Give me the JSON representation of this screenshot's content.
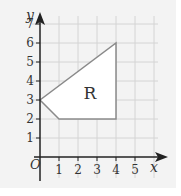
{
  "figure": {
    "type": "coordinate-grid-diagram",
    "axes": {
      "x_label": "x",
      "y_label": "y",
      "origin_label": "O",
      "x_ticks": [
        "1",
        "2",
        "3",
        "4",
        "5"
      ],
      "y_ticks": [
        "1",
        "2",
        "3",
        "4",
        "5",
        "6",
        "7"
      ]
    },
    "region": {
      "label": "R",
      "vertices": [
        [
          0,
          3
        ],
        [
          1,
          2
        ],
        [
          4,
          2
        ],
        [
          4,
          6
        ]
      ]
    },
    "colors": {
      "background": "#f3f3f3",
      "grid": "#d4d4d4",
      "axis": "#222222",
      "region_fill": "#ffffff",
      "region_stroke": "#8a8a8a"
    }
  }
}
